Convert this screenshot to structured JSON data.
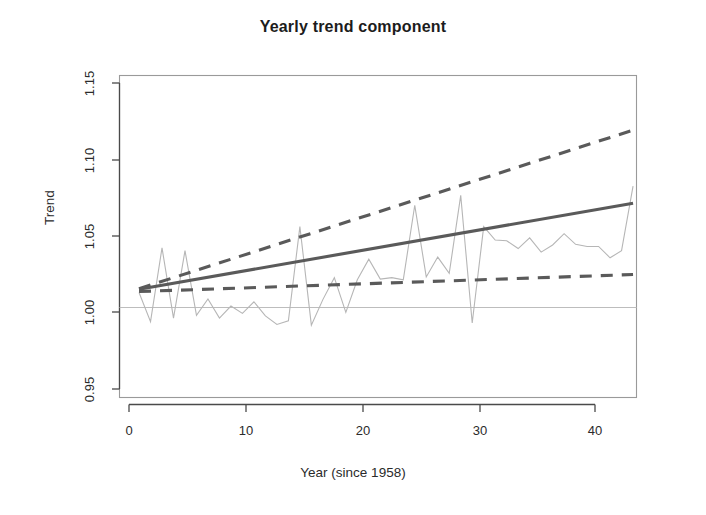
{
  "chart_data": {
    "type": "line",
    "title": "Yearly trend component",
    "xlabel": "Year (since 1958)",
    "ylabel": "Trend",
    "xlim": [
      -0.7,
      44.3
    ],
    "ylim": [
      0.9365,
      1.1635
    ],
    "xticks": [
      0,
      10,
      20,
      30,
      40
    ],
    "xtick_labels": [
      "0",
      "10",
      "20",
      "30",
      "40"
    ],
    "yticks": [
      0.95,
      1.0,
      1.05,
      1.1,
      1.15
    ],
    "ytick_labels": [
      "0.95",
      "1.00",
      "1.05",
      "1.10",
      "1.15"
    ],
    "grid": false,
    "legend": "none",
    "annotations": [
      {
        "kind": "reference-line",
        "orientation": "horizontal",
        "y": 1.0,
        "color": "#bdbdbd"
      }
    ],
    "colors": {
      "trend": "#5a5a5a",
      "confidence_band": "#5a5a5a",
      "observed": "#b6b6b6",
      "reference_line": "#bdbdbd",
      "axis": "#4a4a4a",
      "title": "#1c1c1c"
    },
    "series": [
      {
        "name": "Trend estimate",
        "style": "solid",
        "color": "#5a5a5a",
        "x": [
          1,
          44
        ],
        "values": [
          1.0128,
          1.0735
        ]
      },
      {
        "name": "Upper confidence bound",
        "style": "dashed",
        "color": "#5a5a5a",
        "x": [
          1,
          44
        ],
        "values": [
          1.0132,
          1.125
        ]
      },
      {
        "name": "Lower confidence bound",
        "style": "dashed",
        "color": "#5a5a5a",
        "x": [
          1,
          44
        ],
        "values": [
          1.0112,
          1.0232
        ]
      },
      {
        "name": "Observed yearly component",
        "style": "solid-thin",
        "color": "#b6b6b6",
        "x": [
          1,
          2,
          3,
          4,
          5,
          6,
          7,
          8,
          9,
          10,
          11,
          12,
          13,
          14,
          15,
          16,
          17,
          18,
          19,
          20,
          21,
          22,
          23,
          24,
          25,
          26,
          27,
          28,
          29,
          30,
          31,
          32,
          33,
          34,
          35,
          36,
          37,
          38,
          39,
          40,
          41,
          42,
          43,
          44
        ],
        "values": [
          1.0105,
          0.99,
          1.042,
          0.9925,
          1.04,
          0.9945,
          1.006,
          0.9925,
          1.001,
          0.9958,
          1.004,
          0.994,
          0.988,
          0.9905,
          1.057,
          0.9875,
          1.0055,
          1.021,
          0.9965,
          1.0195,
          1.034,
          1.02,
          1.021,
          1.0195,
          1.072,
          1.0215,
          1.0355,
          1.024,
          1.079,
          0.989,
          1.057,
          1.0475,
          1.047,
          1.0415,
          1.049,
          1.039,
          1.044,
          1.052,
          1.0445,
          1.043,
          1.043,
          1.035,
          1.04,
          1.0855
        ]
      }
    ]
  }
}
